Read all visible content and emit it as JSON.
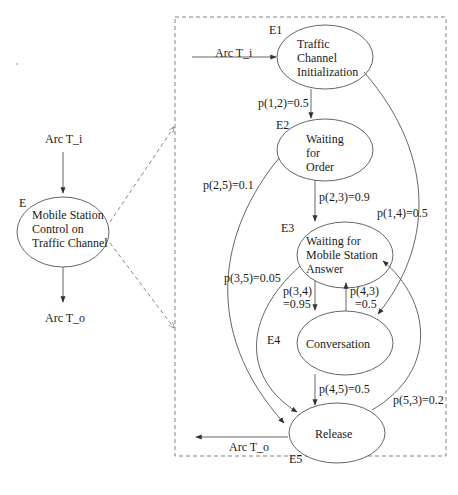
{
  "colors": {
    "stroke": "#555555",
    "text": "#1a1a1a",
    "dashed": "#777777",
    "background": "#ffffff"
  },
  "left_model": {
    "input_arc": "Arc T_i",
    "output_arc": "Arc T_o",
    "node": {
      "id": "E",
      "lines": [
        "Mobile Station",
        "Control on",
        "Traffic Channel"
      ]
    }
  },
  "detail_model": {
    "input_arc": "Arc T_i",
    "output_arc": "Arc T_o",
    "nodes": [
      {
        "id": "E1",
        "lines": [
          "Traffic",
          "Channel",
          "Initialization"
        ]
      },
      {
        "id": "E2",
        "lines": [
          "Waiting",
          "for",
          "Order"
        ]
      },
      {
        "id": "E3",
        "lines": [
          "Waiting for",
          "Mobile Station",
          "Answer"
        ]
      },
      {
        "id": "E4",
        "lines": [
          "Conversation"
        ]
      },
      {
        "id": "E5",
        "lines": [
          "Release"
        ]
      }
    ],
    "transitions": {
      "p12": "p(1,2)=0.5",
      "p23": "p(2,3)=0.9",
      "p25": "p(2,5)=0.1",
      "p14": "p(1,4)=0.5",
      "p35": "p(3,5)=0.05",
      "p34_a": "p(3,4)",
      "p34_b": "=0.95",
      "p43_a": "p(4,3)",
      "p43_b": "=0.5",
      "p45": "p(4,5)=0.5",
      "p53": "p(5,3)=0.2"
    }
  }
}
